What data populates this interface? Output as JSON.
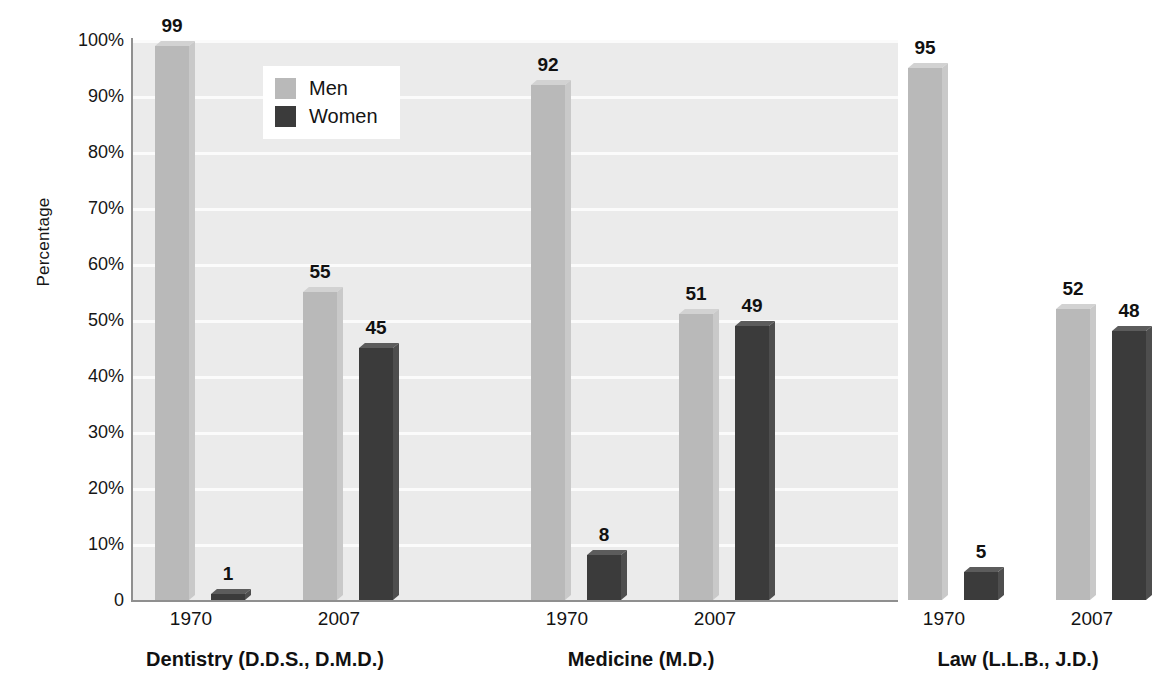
{
  "chart_data": {
    "type": "bar",
    "title": "",
    "xlabel": "",
    "ylabel": "Percentage",
    "ylim": [
      0,
      100
    ],
    "grid": true,
    "legend_position": "top-left-inside",
    "categories": [
      "1970",
      "2007",
      "1970",
      "2007",
      "1970",
      "2007"
    ],
    "groups": [
      {
        "label": "Dentistry (D.D.S., D.M.D.)",
        "years": [
          {
            "year": "1970",
            "men": 99,
            "women": 1
          },
          {
            "year": "2007",
            "men": 55,
            "women": 45
          }
        ]
      },
      {
        "label": "Medicine (M.D.)",
        "years": [
          {
            "year": "1970",
            "men": 92,
            "women": 8
          },
          {
            "year": "2007",
            "men": 51,
            "women": 49
          }
        ]
      },
      {
        "label": "Law (L.L.B., J.D.)",
        "years": [
          {
            "year": "1970",
            "men": 95,
            "women": 5
          },
          {
            "year": "2007",
            "men": 52,
            "women": 48
          }
        ]
      }
    ],
    "series": [
      {
        "name": "Men",
        "color": "#b9b9b9",
        "values": [
          99,
          55,
          92,
          51,
          95,
          52
        ]
      },
      {
        "name": "Women",
        "color": "#3b3b3b",
        "values": [
          1,
          45,
          8,
          49,
          5,
          48
        ]
      }
    ],
    "y_ticks": [
      "100%",
      "90%",
      "80%",
      "70%",
      "60%",
      "50%",
      "40%",
      "30%",
      "20%",
      "10%",
      "0"
    ],
    "y_tick_values": [
      100,
      90,
      80,
      70,
      60,
      50,
      40,
      30,
      20,
      10,
      0
    ]
  },
  "legend": {
    "items": [
      {
        "label": "Men",
        "color": "#b9b9b9"
      },
      {
        "label": "Women",
        "color": "#3b3b3b"
      }
    ]
  },
  "axes": {
    "y_title": "Percentage"
  },
  "colors": {
    "plot_background": "#ebebeb",
    "gridline": "#fbfbfb",
    "axis_line": "#8f8f8f",
    "men_bar": "#b9b9b9",
    "women_bar": "#3b3b3b",
    "text": "#111111"
  }
}
